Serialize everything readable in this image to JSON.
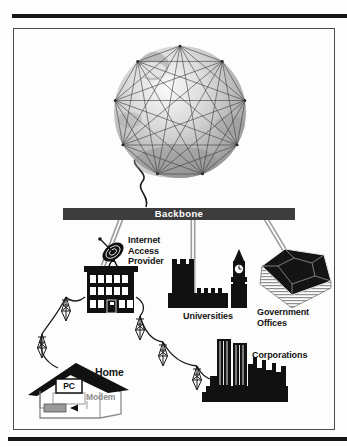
{
  "figure": {
    "labels": {
      "backbone": "Backbone",
      "isp": "Internet\nAccess\nProvider",
      "universities": "Universities",
      "government": "Government\nOffices",
      "corporations": "Corporations",
      "home": "Home",
      "pc": "PC",
      "modem": "Modem"
    },
    "icons": [
      "globe-icon",
      "satellite-dish-icon",
      "office-building-icon",
      "university-building-icon",
      "pentagon-building-icon",
      "city-skyline-icon",
      "house-icon",
      "telephone-pole-icon",
      "monitor-icon",
      "modem-box-icon",
      "arrow-left-icon"
    ],
    "colors": {
      "backbone_bar": "#3d3d3d",
      "backbone_text": "#ffffff",
      "silhouette": "#111111",
      "connector_line": "#9c9c9c",
      "wire": "#1b1b1b",
      "label_text": "#131313",
      "modem_label_text": "#8d8d8d",
      "frame_border": "#4d4d4d"
    }
  }
}
